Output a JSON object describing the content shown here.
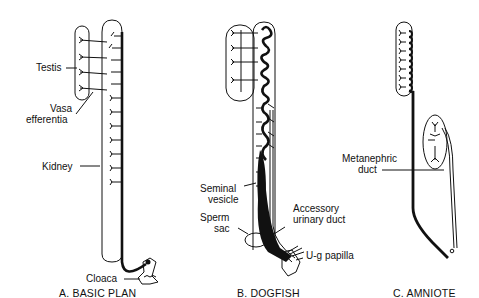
{
  "figure": {
    "panels": [
      {
        "id": "A",
        "caption": "A. BASIC PLAN",
        "labels": {
          "testis": "Testis",
          "vasa_1": "Vasa",
          "vasa_2": "efferentia",
          "kidney": "Kidney",
          "cloaca": "Cloaca"
        }
      },
      {
        "id": "B",
        "caption": "B. DOGFISH",
        "labels": {
          "seminal_1": "Seminal",
          "seminal_2": "vesicle",
          "sperm_1": "Sperm",
          "sperm_2": "sac",
          "accessory_1": "Accessory",
          "accessory_2": "urinary duct",
          "ug_papilla": "U-g papilla"
        }
      },
      {
        "id": "C",
        "caption": "C. AMNIOTE",
        "labels": {
          "metanephric_1": "Metanephric",
          "metanephric_2": "duct"
        }
      }
    ],
    "colors": {
      "ink": "#111111",
      "background": "#ffffff"
    }
  }
}
